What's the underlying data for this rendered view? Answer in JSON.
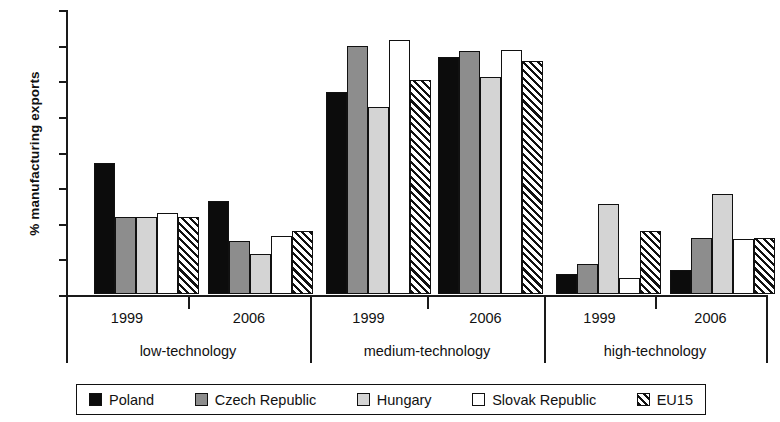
{
  "chart_data": {
    "type": "bar",
    "title": "",
    "xlabel": "",
    "ylabel": "% manufacturing exports",
    "ylim": [
      0,
      80
    ],
    "yticks": [
      0,
      10,
      20,
      30,
      40,
      50,
      60,
      70,
      80
    ],
    "grid": false,
    "legend_position": "bottom",
    "groups": [
      "low-technology",
      "medium-technology",
      "high-technology"
    ],
    "subgroups": [
      "1999",
      "2006"
    ],
    "categories": [
      "low-technology 1999",
      "low-technology 2006",
      "medium-technology 1999",
      "medium-technology 2006",
      "high-technology 1999",
      "high-technology 2006"
    ],
    "series": [
      {
        "name": "Poland",
        "color": "#0c0c0c",
        "pattern": "solid",
        "values": [
          36.8,
          26.2,
          56.8,
          66.5,
          5.7,
          6.8
        ]
      },
      {
        "name": "Czech Republic",
        "color": "#8d8d8d",
        "pattern": "solid",
        "values": [
          21.6,
          15.0,
          69.5,
          68.3,
          8.4,
          15.8
        ]
      },
      {
        "name": "Hungary",
        "color": "#d4d4d4",
        "pattern": "solid",
        "values": [
          21.6,
          11.2,
          52.6,
          61.0,
          25.2,
          28.0
        ]
      },
      {
        "name": "Slovak Republic",
        "color": "#ffffff",
        "pattern": "solid",
        "values": [
          22.8,
          16.2,
          71.4,
          68.5,
          4.4,
          15.4
        ]
      },
      {
        "name": "EU15",
        "color": "#ffffff",
        "pattern": "hatch",
        "values": [
          21.6,
          17.8,
          60.0,
          65.4,
          17.8,
          15.6
        ]
      }
    ]
  },
  "axis": {
    "y_label": "% manufacturing exports",
    "y_ticks": [
      "0",
      "10",
      "20",
      "30",
      "40",
      "50",
      "60",
      "70",
      "80"
    ]
  },
  "xaxis": {
    "groups": [
      {
        "label": "low-technology",
        "years": [
          "1999",
          "2006"
        ]
      },
      {
        "label": "medium-technology",
        "years": [
          "1999",
          "2006"
        ]
      },
      {
        "label": "high-technology",
        "years": [
          "1999",
          "2006"
        ]
      }
    ]
  },
  "legend": {
    "items": [
      {
        "label": "Poland",
        "swatch": "solid-black"
      },
      {
        "label": "Czech Republic",
        "swatch": "solid-darkgray"
      },
      {
        "label": "Hungary",
        "swatch": "solid-lightgray"
      },
      {
        "label": "Slovak Republic",
        "swatch": "solid-white"
      },
      {
        "label": "EU15",
        "swatch": "diagonal-hatch"
      }
    ]
  }
}
